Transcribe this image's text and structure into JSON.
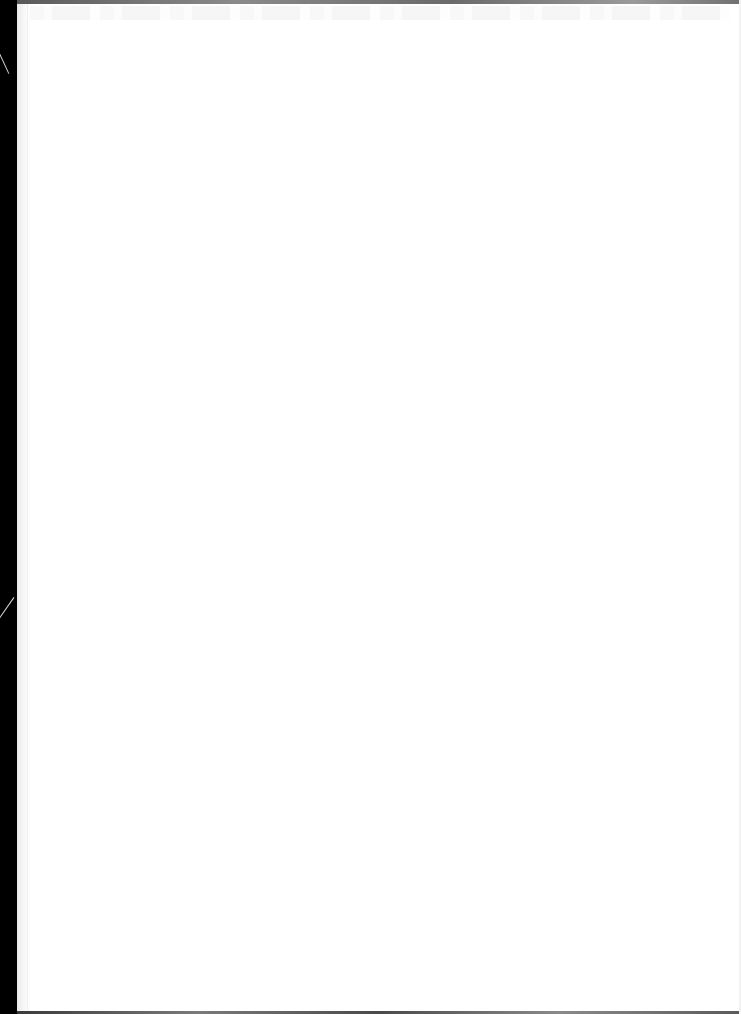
{
  "document": {
    "type": "scanned-page",
    "page_state": "blank",
    "visible_text": "",
    "colors": {
      "page": "#ffffff",
      "binding_edge": "#000000",
      "border": "#6a6a6a"
    }
  }
}
